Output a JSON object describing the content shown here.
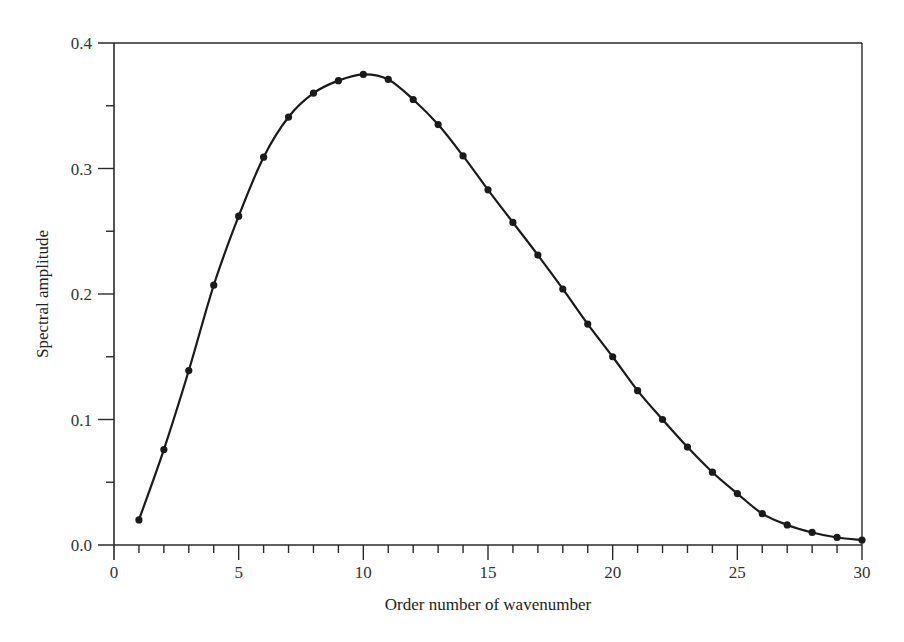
{
  "chart_data": {
    "type": "line",
    "title": "",
    "xlabel": "Order number of  wavenumber",
    "ylabel": "Spectral amplitude",
    "xlim": [
      0,
      30
    ],
    "ylim": [
      0.0,
      0.4
    ],
    "grid": false,
    "legend": null,
    "x_ticks_major": [
      0,
      5,
      10,
      15,
      20,
      25,
      30
    ],
    "x_tick_labels": [
      "0",
      "5",
      "10",
      "15",
      "20",
      "25",
      "30"
    ],
    "x_ticks_minor_step": 1,
    "y_ticks_major": [
      0.0,
      0.1,
      0.2,
      0.3,
      0.4
    ],
    "y_tick_labels": [
      "0.0",
      "0.1",
      "0.2",
      "0.3",
      "0.4"
    ],
    "y_ticks_minor_step": 0.05,
    "series": [
      {
        "name": "Spectral amplitude",
        "color": "#1a1a1a",
        "marker": "circle",
        "x": [
          1,
          2,
          3,
          4,
          5,
          6,
          7,
          8,
          9,
          10,
          11,
          12,
          13,
          14,
          15,
          16,
          17,
          18,
          19,
          20,
          21,
          22,
          23,
          24,
          25,
          26,
          27,
          28,
          29,
          30
        ],
        "values": [
          0.02,
          0.076,
          0.139,
          0.207,
          0.262,
          0.309,
          0.341,
          0.36,
          0.37,
          0.375,
          0.371,
          0.355,
          0.335,
          0.31,
          0.283,
          0.257,
          0.231,
          0.204,
          0.176,
          0.15,
          0.123,
          0.1,
          0.078,
          0.058,
          0.041,
          0.025,
          0.016,
          0.01,
          0.006,
          0.004
        ]
      }
    ]
  },
  "layout": {
    "plot_left": 114,
    "plot_right": 862,
    "plot_top": 43,
    "plot_bottom": 545
  }
}
